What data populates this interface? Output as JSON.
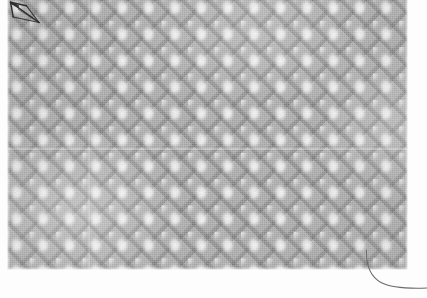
{
  "image": {
    "subject": "woven textile swatch",
    "weave_type": "honeycomb / waffle weave",
    "capture_mode": "grayscale macro photograph",
    "canvas": {
      "width": 427,
      "height": 298
    },
    "background_color": "#fdfdfd"
  },
  "specimen": {
    "label": "fabric-swatch",
    "bounds": {
      "x": 7,
      "y": 0,
      "width": 401,
      "height": 270
    },
    "base_color": "#a6a6a6",
    "highlight_color": "#fafafa",
    "shadow_color": "#606060",
    "cell_pitch_px": 26.4,
    "structure": "light oval floats arranged on a square lattice separated by darker diagonal ridges"
  },
  "features": [
    {
      "name": "arrow-annotation",
      "kind": "hand-drawn ink arrow",
      "description": "dark pen arrow at upper-left pointing up and to the left",
      "color": "#2e2e2e",
      "position": {
        "x": 6,
        "y": 0,
        "width": 42,
        "height": 30
      }
    },
    {
      "name": "loose-thread",
      "kind": "stray fibre",
      "description": "single thin thread emerging from the lower-right edge and curving to the right margin",
      "color": "#6b6b6b",
      "position": {
        "x": 355,
        "y": 248,
        "width": 72,
        "height": 50
      }
    },
    {
      "name": "horizontal-seam",
      "kind": "light seam line",
      "description": "faint pale horizontal join across the middle of the swatch",
      "y": 148
    },
    {
      "name": "vertical-seam",
      "kind": "light seam line",
      "description": "faint pale vertical join near the left third of the swatch",
      "x": 88
    }
  ]
}
